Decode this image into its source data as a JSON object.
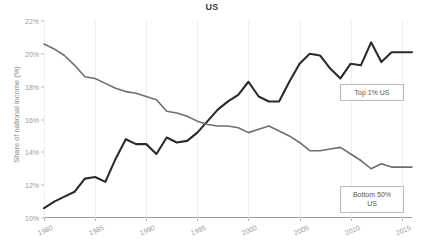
{
  "chart_data": {
    "type": "line",
    "title": "US",
    "xlabel": "",
    "ylabel": "Share of national income (%)",
    "xlim": [
      1980,
      2016
    ],
    "ylim": [
      10,
      22
    ],
    "ytick_labels": [
      "10%",
      "12%",
      "14%",
      "16%",
      "18%",
      "20%",
      "22%"
    ],
    "ytick_values": [
      10,
      12,
      14,
      16,
      18,
      20,
      22
    ],
    "xtick_labels": [
      "1980",
      "1985",
      "1990",
      "1995",
      "2000",
      "2005",
      "2010",
      "2015"
    ],
    "xtick_values": [
      1980,
      1985,
      1990,
      1995,
      2000,
      2005,
      2010,
      2015
    ],
    "grid": "vertical",
    "legend_position": "inline-right",
    "x": [
      1980,
      1981,
      1982,
      1983,
      1984,
      1985,
      1986,
      1987,
      1988,
      1989,
      1990,
      1991,
      1992,
      1993,
      1994,
      1995,
      1996,
      1997,
      1998,
      1999,
      2000,
      2001,
      2002,
      2003,
      2004,
      2005,
      2006,
      2007,
      2008,
      2009,
      2010,
      2011,
      2012,
      2013,
      2014,
      2015,
      2016
    ],
    "series": [
      {
        "name": "Top 1% US",
        "color": "#2b2b2b",
        "values": [
          10.6,
          11.0,
          11.3,
          11.6,
          12.4,
          12.5,
          12.2,
          13.6,
          14.8,
          14.5,
          14.5,
          13.9,
          14.9,
          14.6,
          14.7,
          15.2,
          15.9,
          16.6,
          17.1,
          17.5,
          18.3,
          17.4,
          17.1,
          17.1,
          18.3,
          19.4,
          20.0,
          19.9,
          19.1,
          18.5,
          19.4,
          19.3,
          20.7,
          19.5,
          20.1,
          20.1,
          20.1
        ]
      },
      {
        "name": "Bottom 50% US",
        "color": "#6e6e6e",
        "values": [
          20.6,
          20.3,
          19.9,
          19.3,
          18.6,
          18.5,
          18.2,
          17.9,
          17.7,
          17.6,
          17.4,
          17.2,
          16.5,
          16.4,
          16.2,
          15.9,
          15.7,
          15.6,
          15.6,
          15.5,
          15.2,
          15.4,
          15.6,
          15.3,
          15.0,
          14.6,
          14.1,
          14.1,
          14.2,
          14.3,
          13.9,
          13.5,
          13.0,
          13.3,
          13.1,
          13.1,
          13.1
        ]
      }
    ]
  },
  "legend": {
    "top1_label": "Top 1% US",
    "bottom50_label": "Bottom 50%\nUS"
  }
}
